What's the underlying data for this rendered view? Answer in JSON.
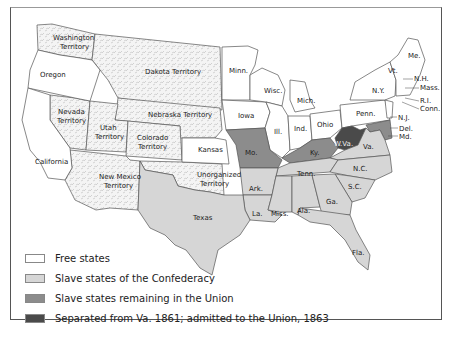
{
  "colors": {
    "free": "#ffffff",
    "confederacy": "#d6d6d6",
    "border_slave": "#8c8c8c",
    "west_virginia": "#4a4a4a",
    "territory_pattern": "#efefef",
    "outline": "#555555"
  },
  "labels": {
    "washington": [
      "Washington",
      "Territory"
    ],
    "oregon": "Oregon",
    "dakota": "Dakota Territory",
    "nebraska": "Nebraska Territory",
    "nevada": [
      "Nevada",
      "Territory"
    ],
    "utah": [
      "Utah",
      "Territory"
    ],
    "colorado": [
      "Colorado",
      "Territory"
    ],
    "california": "California",
    "new_mexico": [
      "New Mexico",
      "Territory"
    ],
    "kansas": "Kansas",
    "unorganized": [
      "Unorganized",
      "Territory"
    ],
    "texas": "Texas",
    "minn": "Minn.",
    "iowa": "Iowa",
    "wisc": "Wisc.",
    "mich": "Mich.",
    "ill": "Ill.",
    "ind": "Ind.",
    "ohio": "Ohio",
    "penn": "Penn.",
    "ny": "N.Y.",
    "vt": "Vt.",
    "me": "Me.",
    "nh": "N.H.",
    "mass": "Mass.",
    "ri": "R.I.",
    "conn": "Conn.",
    "nj": "N.J.",
    "del": "Del.",
    "md": "Md.",
    "mo": "Mo.",
    "ky": "Ky.",
    "wva": "W.Va.",
    "va": "Va.",
    "nc": "N.C.",
    "sc": "S.C.",
    "tenn": "Tenn.",
    "ark": "Ark.",
    "la": "La.",
    "miss": "Miss.",
    "ala": "Ala.",
    "ga": "Ga.",
    "fla": "Fla."
  },
  "legend": [
    {
      "label": "Free states",
      "color": "#ffffff"
    },
    {
      "label": "Slave states of the Confederacy",
      "color": "#d6d6d6"
    },
    {
      "label": "Slave states remaining in the Union",
      "color": "#8c8c8c"
    },
    {
      "label": "Separated from Va. 1861; admitted to the Union, 1863",
      "color": "#4a4a4a"
    }
  ]
}
